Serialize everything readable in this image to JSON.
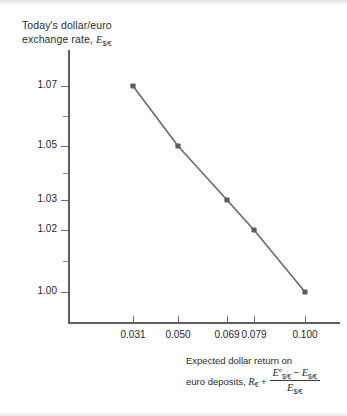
{
  "figure": {
    "y_axis_title_line1": "Today's dollar/euro",
    "y_axis_title_line2_prefix": "exchange rate, ",
    "y_axis_title_symbol": "E",
    "y_axis_title_subscript": "$/€",
    "x_axis_caption_line1": "Expected dollar return on",
    "x_axis_caption_line2_prefix": "euro deposits, ",
    "x_axis_caption_rate_symbol": "R",
    "x_axis_caption_rate_subscript": "€",
    "x_axis_caption_plus": " + ",
    "fraction_numerator_term1_symbol": "E",
    "fraction_numerator_term1_superscript": "e",
    "fraction_numerator_term1_subscript": "$/€",
    "fraction_numerator_minus": " − ",
    "fraction_numerator_term2_symbol": "E",
    "fraction_numerator_term2_subscript": "$/€",
    "fraction_denominator_symbol": "E",
    "fraction_denominator_subscript": "$/€"
  },
  "colors": {
    "series_line": "#6b6b6b",
    "marker_fill": "#5e5e5e",
    "axis": "#5e5e5e",
    "text": "#1f1f1f",
    "background": "#ffffff"
  },
  "chart_data": {
    "type": "line",
    "title": "Today's dollar/euro exchange rate, E$/€",
    "xlabel": "Expected dollar return on euro deposits, R€ + (E^e$/€ − E$/€)/E$/€",
    "ylabel": "Today's dollar/euro exchange rate, E$/€",
    "x": [
      0.031,
      0.05,
      0.069,
      0.079,
      0.1
    ],
    "values": [
      1.07,
      1.05,
      1.03,
      1.02,
      1.0
    ],
    "x_tick_labels": [
      "0.031",
      "0.050",
      "0.069",
      "0.079",
      "0.100"
    ],
    "y_tick_labels": [
      "1.07",
      "1.05",
      "1.03",
      "1.02",
      "1.00"
    ],
    "y_minor_ticks": [
      1.06,
      1.04,
      1.01
    ],
    "ylim": [
      0.995,
      1.082
    ],
    "xlim": [
      0.0,
      0.118
    ],
    "grid": false,
    "legend": false,
    "markers": "square",
    "series_color": "#6b6b6b"
  }
}
